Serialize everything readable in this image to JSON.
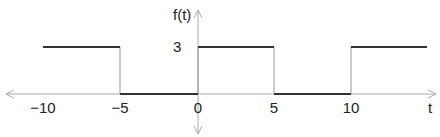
{
  "chart_data": {
    "type": "line",
    "title": "",
    "xlabel": "t",
    "ylabel": "f(t)",
    "x_ticks": [
      "−10",
      "−5",
      "0",
      "5",
      "10"
    ],
    "y_ticks": [
      "3"
    ],
    "segments": [
      {
        "x_start": -10,
        "x_end": -5,
        "y": 3
      },
      {
        "x_start": -5,
        "x_end": 0,
        "y": 0
      },
      {
        "x_start": 0,
        "x_end": 5,
        "y": 3
      },
      {
        "x_start": 5,
        "x_end": 10,
        "y": 0
      },
      {
        "x_start": 10,
        "x_end": 15,
        "y": 3
      }
    ]
  },
  "labels": {
    "y_axis": "f(t)",
    "x_axis": "t",
    "level": "3",
    "tick_m10": "−10",
    "tick_m5": "−5",
    "tick_0": "0",
    "tick_5": "5",
    "tick_10": "10"
  }
}
